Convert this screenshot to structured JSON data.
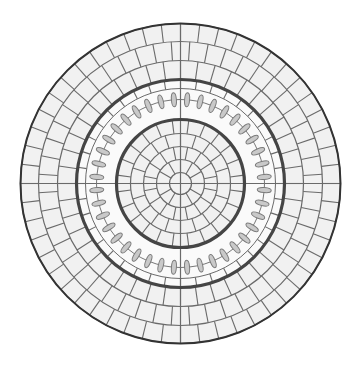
{
  "diagram": {
    "center": [
      180.5,
      183.5
    ],
    "colors": {
      "background": "#ffffff",
      "tile_fill": "#f1f1f1",
      "tile_line": "#6a6a6a",
      "thick_ring": "#454545",
      "outer_ring": "#333333",
      "ellipse_fill": "#c9c9c9",
      "ellipse_stroke": "#7a7a7a",
      "connector": "#777777"
    },
    "outer_radius": 160,
    "thick_rings": [
      64,
      104
    ],
    "inner_zone": {
      "center_circle_radius": 11,
      "rings": [
        {
          "r0": 11,
          "r1": 24,
          "segments": 12,
          "offset": 0
        },
        {
          "r0": 24,
          "r1": 37,
          "segments": 16,
          "offset": 0.5
        },
        {
          "r0": 37,
          "r1": 50,
          "segments": 20,
          "offset": 0
        },
        {
          "r0": 50,
          "r1": 64,
          "segments": 24,
          "offset": 0.5
        }
      ]
    },
    "ellipse_band": {
      "r0": 64,
      "r1": 104,
      "connector_radius": 84,
      "ellipse_count": 40,
      "ellipse_length": 14,
      "ellipse_width": 5,
      "offset": 0.5,
      "outer_tile_ring": {
        "r0": 95,
        "r1": 104,
        "segments": 40,
        "offset": 0
      }
    },
    "outer_zone": {
      "rings": [
        {
          "r0": 104,
          "r1": 123,
          "segments": 44,
          "offset": 0
        },
        {
          "r0": 123,
          "r1": 142,
          "segments": 48,
          "offset": 0.5
        },
        {
          "r0": 142,
          "r1": 160,
          "segments": 52,
          "offset": 0
        }
      ]
    },
    "axes_lines": true
  }
}
